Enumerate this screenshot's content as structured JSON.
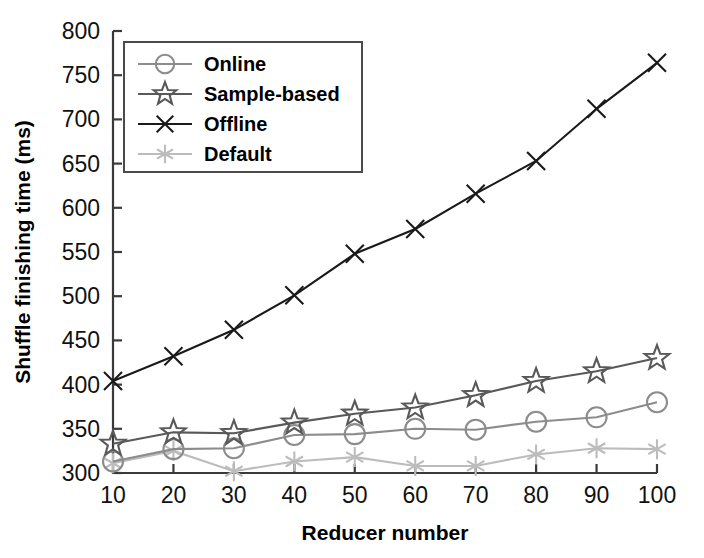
{
  "chart_data": {
    "type": "line",
    "title": "",
    "xlabel": "Reducer number",
    "ylabel": "Shuffle finishing time (ms)",
    "x": [
      10,
      20,
      30,
      40,
      50,
      60,
      70,
      80,
      90,
      100
    ],
    "xlim": [
      10,
      100
    ],
    "ylim": [
      300,
      800
    ],
    "xticks": [
      "10",
      "20",
      "30",
      "40",
      "50",
      "60",
      "70",
      "80",
      "90",
      "100"
    ],
    "yticks": [
      "300",
      "350",
      "400",
      "450",
      "500",
      "550",
      "600",
      "650",
      "700",
      "750",
      "800"
    ],
    "grid": false,
    "legend_position": "upper-left",
    "series": [
      {
        "name": "Online",
        "marker": "circle",
        "color": "#8c8c8c",
        "values": [
          313,
          327,
          328,
          343,
          344,
          350,
          349,
          358,
          363,
          380
        ]
      },
      {
        "name": "Sample-based",
        "marker": "star",
        "color": "#595959",
        "values": [
          333,
          346,
          345,
          357,
          367,
          374,
          388,
          404,
          415,
          430
        ]
      },
      {
        "name": "Offline",
        "marker": "x",
        "color": "#1a1a1a",
        "values": [
          404,
          432,
          462,
          501,
          548,
          576,
          616,
          653,
          712,
          764
        ]
      },
      {
        "name": "Default",
        "marker": "asterisk",
        "color": "#bcbcbc",
        "values": [
          311,
          325,
          302,
          313,
          318,
          308,
          308,
          321,
          328,
          327
        ]
      }
    ]
  },
  "legend": {
    "entries": [
      {
        "label": "Online"
      },
      {
        "label": "Sample-based"
      },
      {
        "label": "Offline"
      },
      {
        "label": "Default"
      }
    ]
  },
  "axes": {
    "x_title": "Reducer number",
    "y_title": "Shuffle finishing time (ms)"
  }
}
